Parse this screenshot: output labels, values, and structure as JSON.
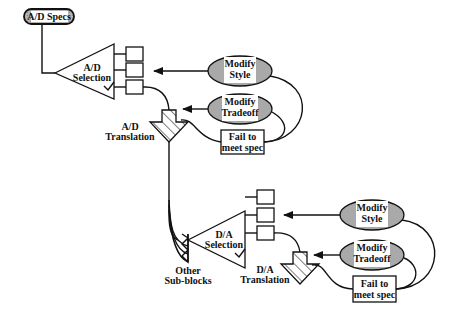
{
  "diagram": {
    "specs_label": "A/D Specs",
    "ad_block": {
      "selection_line1": "A/D",
      "selection_line2": "Selection",
      "translation_line1": "A/D",
      "translation_line2": "Translation",
      "modify_style_line1": "Modify",
      "modify_style_line2": "Style",
      "modify_tradeoff_line1": "Modify",
      "modify_tradeoff_line2": "Tradeoff",
      "fail_line1": "Fail to",
      "fail_line2": "meet spec"
    },
    "da_block": {
      "selection_line1": "D/A",
      "selection_line2": "Selection",
      "translation_line1": "D/A",
      "translation_line2": "Translation",
      "modify_style_line1": "Modify",
      "modify_style_line2": "Style",
      "modify_tradeoff_line1": "Modify",
      "modify_tradeoff_line2": "Tradeoff",
      "fail_line1": "Fail to",
      "fail_line2": "meet spec"
    },
    "other_line1": "Other",
    "other_line2": "Sub-blocks",
    "colors": {
      "oval_fill": "#a9a9a9",
      "stroke": "#111111"
    }
  }
}
